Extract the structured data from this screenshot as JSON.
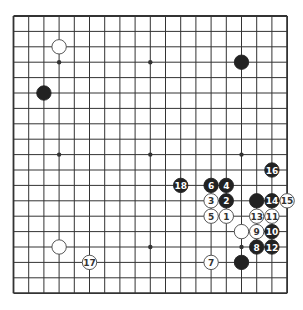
{
  "board": {
    "size": 19,
    "colors": {
      "line": "#333333",
      "black": "#222222",
      "white": "#ffffff",
      "black_label": "#ffffff",
      "white_label": "#333333"
    },
    "star_points": [
      [
        3,
        3
      ],
      [
        9,
        3
      ],
      [
        15,
        3
      ],
      [
        3,
        9
      ],
      [
        9,
        9
      ],
      [
        15,
        9
      ],
      [
        3,
        15
      ],
      [
        9,
        15
      ],
      [
        15,
        15
      ]
    ],
    "stones": [
      {
        "col": 3,
        "row": 2,
        "color": "white",
        "label": ""
      },
      {
        "col": 2,
        "row": 5,
        "color": "black",
        "label": ""
      },
      {
        "col": 15,
        "row": 3,
        "color": "black",
        "label": ""
      },
      {
        "col": 17,
        "row": 10,
        "color": "black",
        "label": "16"
      },
      {
        "col": 11,
        "row": 11,
        "color": "black",
        "label": "18"
      },
      {
        "col": 13,
        "row": 11,
        "color": "black",
        "label": "6"
      },
      {
        "col": 14,
        "row": 11,
        "color": "black",
        "label": "4"
      },
      {
        "col": 13,
        "row": 12,
        "color": "white",
        "label": "3"
      },
      {
        "col": 14,
        "row": 12,
        "color": "black",
        "label": "2"
      },
      {
        "col": 16,
        "row": 12,
        "color": "black",
        "label": ""
      },
      {
        "col": 17,
        "row": 12,
        "color": "black",
        "label": "14"
      },
      {
        "col": 18,
        "row": 12,
        "color": "white",
        "label": "15"
      },
      {
        "col": 13,
        "row": 13,
        "color": "white",
        "label": "5"
      },
      {
        "col": 14,
        "row": 13,
        "color": "white",
        "label": "1"
      },
      {
        "col": 16,
        "row": 13,
        "color": "white",
        "label": "13"
      },
      {
        "col": 17,
        "row": 13,
        "color": "white",
        "label": "11"
      },
      {
        "col": 15,
        "row": 14,
        "color": "white",
        "label": ""
      },
      {
        "col": 16,
        "row": 14,
        "color": "white",
        "label": "9"
      },
      {
        "col": 17,
        "row": 14,
        "color": "black",
        "label": "10"
      },
      {
        "col": 16,
        "row": 15,
        "color": "black",
        "label": "8"
      },
      {
        "col": 17,
        "row": 15,
        "color": "black",
        "label": "12"
      },
      {
        "col": 13,
        "row": 16,
        "color": "white",
        "label": "7"
      },
      {
        "col": 15,
        "row": 16,
        "color": "black",
        "label": ""
      },
      {
        "col": 3,
        "row": 15,
        "color": "white",
        "label": ""
      },
      {
        "col": 5,
        "row": 16,
        "color": "white",
        "label": "17"
      }
    ]
  }
}
